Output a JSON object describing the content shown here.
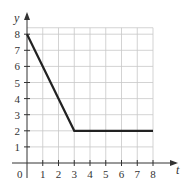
{
  "chart_data": {
    "type": "line",
    "title": "",
    "xlabel": "t",
    "ylabel": "y",
    "origin_label": "0",
    "x_ticks": [
      "1",
      "2",
      "3",
      "4",
      "5",
      "6",
      "7",
      "8"
    ],
    "y_ticks": [
      "1",
      "2",
      "3",
      "4",
      "5",
      "6",
      "7",
      "8"
    ],
    "xlim": [
      0,
      8
    ],
    "ylim": [
      0,
      8
    ],
    "grid": true,
    "series": [
      {
        "name": "y(t)",
        "x": [
          0,
          3,
          8
        ],
        "y": [
          8,
          2,
          2
        ]
      }
    ],
    "colors": {
      "line": "#222222",
      "grid": "#c8c8c8",
      "axis": "#333333"
    }
  }
}
